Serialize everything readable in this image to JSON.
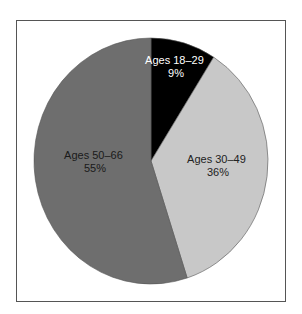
{
  "chart_data": {
    "type": "pie",
    "title": "",
    "start_angle": "12 o'clock",
    "direction": "clockwise",
    "categories": [
      "Ages 18–29",
      "Ages 30–49",
      "Ages 50–66"
    ],
    "values": [
      9,
      36,
      55
    ],
    "value_labels": [
      "9%",
      "36%",
      "55%"
    ],
    "colors": [
      "#000000",
      "#c8c8c8",
      "#6e6e6e"
    ],
    "label_colors": [
      "#ffffff",
      "#222222",
      "#1a1a1a"
    ],
    "legend": "none",
    "frame": true
  },
  "labels": {
    "slice0": {
      "name": "Ages 18–29",
      "pct": "9%"
    },
    "slice1": {
      "name": "Ages 30–49",
      "pct": "36%"
    },
    "slice2": {
      "name": "Ages 50–66",
      "pct": "55%"
    }
  }
}
